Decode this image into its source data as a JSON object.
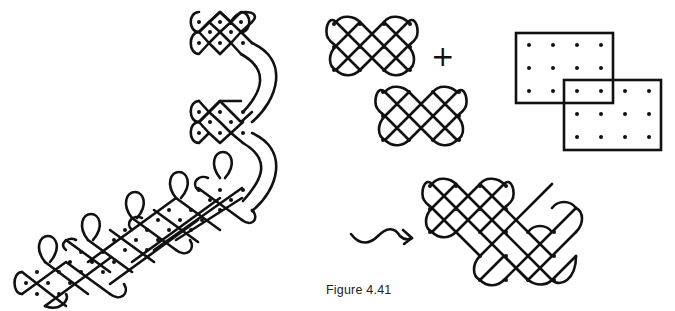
{
  "figure": {
    "caption": "Figure 4.41",
    "operator_symbol": "+",
    "ink_color": "#111111",
    "background_color": "#ffffff"
  },
  "panels": [
    {
      "name": "kolam-chain",
      "description": "Chain of lattice kolam motifs with petal loops joined by curved strands"
    },
    {
      "name": "kolam-a",
      "description": "4x3 dot lattice kolam",
      "dots": {
        "cols": 4,
        "rows": 3
      }
    },
    {
      "name": "kolam-b",
      "description": "4x3 dot lattice kolam",
      "dots": {
        "cols": 4,
        "rows": 3
      }
    },
    {
      "name": "overlapping-dot-grids",
      "description": "Two 4x3 dot grids in frames overlapping by 2x1 dots"
    },
    {
      "name": "merged-kolam",
      "description": "Combined kolam over merged dot grid"
    },
    {
      "name": "wavy-arrow",
      "description": "Arrow indicating the result"
    }
  ]
}
